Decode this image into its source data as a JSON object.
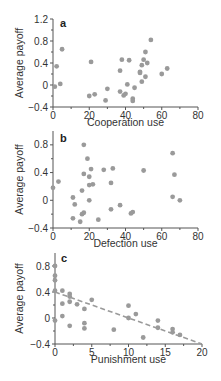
{
  "chart_data": [
    {
      "type": "scatter",
      "panel_label": "a",
      "xlabel": "Cooperation use",
      "ylabel": "Average payoff",
      "xlim": [
        0,
        80
      ],
      "ylim": [
        -0.4,
        1.2
      ],
      "xticks": [
        0,
        20,
        40,
        60,
        80
      ],
      "yticks": [
        -0.4,
        0,
        0.4,
        0.8,
        1.2
      ],
      "ytick_labels": [
        "−0.4",
        "0",
        "0.4",
        "0.8",
        "1.2"
      ],
      "grid": false,
      "points": [
        [
          1,
          -0.03
        ],
        [
          2,
          0.34
        ],
        [
          4,
          0.02
        ],
        [
          5,
          0.65
        ],
        [
          20,
          -0.2
        ],
        [
          21,
          0.42
        ],
        [
          23,
          -0.17
        ],
        [
          29,
          -0.28
        ],
        [
          30,
          -0.07
        ],
        [
          37,
          0.26
        ],
        [
          37,
          -0.12
        ],
        [
          38,
          0.46
        ],
        [
          39,
          -0.19
        ],
        [
          40,
          -0.16
        ],
        [
          41,
          0.01
        ],
        [
          42,
          0.45
        ],
        [
          44,
          -0.25
        ],
        [
          44,
          -0.29
        ],
        [
          45,
          -0.05
        ],
        [
          48,
          0.24
        ],
        [
          48,
          0.22
        ],
        [
          49,
          0.36
        ],
        [
          49,
          0.06
        ],
        [
          50,
          0.46
        ],
        [
          51,
          0.6
        ],
        [
          51,
          0.15
        ],
        [
          52,
          0.4
        ],
        [
          54,
          0.82
        ],
        [
          60,
          0.2
        ],
        [
          63,
          0.3
        ]
      ]
    },
    {
      "type": "scatter",
      "panel_label": "b",
      "xlabel": "Defection use",
      "ylabel": "Average payoff",
      "xlim": [
        0,
        80
      ],
      "ylim": [
        -0.4,
        1.0
      ],
      "xticks": [
        0,
        20,
        40,
        60,
        80
      ],
      "yticks": [
        -0.4,
        0,
        0.4,
        0.8
      ],
      "ytick_labels": [
        "−0.4",
        "0",
        "0.4",
        "0.8"
      ],
      "grid": false,
      "points": [
        [
          0,
          0.18
        ],
        [
          3,
          0.27
        ],
        [
          11,
          0.04
        ],
        [
          11,
          -0.26
        ],
        [
          12,
          -0.06
        ],
        [
          15,
          -0.31
        ],
        [
          16,
          0.14
        ],
        [
          16,
          -0.2
        ],
        [
          17,
          0.8
        ],
        [
          17,
          0.38
        ],
        [
          17,
          -0.18
        ],
        [
          19,
          0.6
        ],
        [
          20,
          0.34
        ],
        [
          20,
          0.22
        ],
        [
          20,
          0.0
        ],
        [
          21,
          0.45
        ],
        [
          22,
          0.23
        ],
        [
          25,
          -0.28
        ],
        [
          28,
          0.44
        ],
        [
          32,
          0.25
        ],
        [
          32,
          -0.13
        ],
        [
          33,
          0.46
        ],
        [
          37,
          -0.07
        ],
        [
          43,
          -0.19
        ],
        [
          44,
          -0.17
        ],
        [
          50,
          0.43
        ],
        [
          66,
          0.68
        ],
        [
          66,
          0.05
        ],
        [
          67,
          0.37
        ],
        [
          70,
          0.0
        ]
      ]
    },
    {
      "type": "scatter",
      "panel_label": "c",
      "xlabel": "Punishment use",
      "ylabel": "Average payoff",
      "xlim": [
        0,
        20
      ],
      "ylim": [
        -0.4,
        1.0
      ],
      "xticks": [
        0,
        5,
        10,
        15,
        20
      ],
      "yticks": [
        -0.4,
        0,
        0.4,
        0.8
      ],
      "ytick_labels": [
        "−0.4",
        "0",
        "0.4",
        "0.8"
      ],
      "grid": false,
      "points": [
        [
          0,
          0.8
        ],
        [
          0,
          0.65
        ],
        [
          0,
          0.58
        ],
        [
          0,
          0.42
        ],
        [
          0,
          -0.04
        ],
        [
          1,
          0.42
        ],
        [
          1,
          0.22
        ],
        [
          1,
          0.03
        ],
        [
          2,
          0.37
        ],
        [
          2,
          0.33
        ],
        [
          2,
          0.25
        ],
        [
          2,
          -0.12
        ],
        [
          3,
          0.21
        ],
        [
          4,
          0.14
        ],
        [
          4,
          -0.08
        ],
        [
          4,
          -0.16
        ],
        [
          5,
          0.28
        ],
        [
          8,
          -0.18
        ],
        [
          10,
          0.19
        ],
        [
          10,
          0.0
        ],
        [
          11,
          0.06
        ],
        [
          12,
          -0.3
        ],
        [
          14,
          -0.04
        ],
        [
          14,
          -0.15
        ],
        [
          16,
          -0.17
        ],
        [
          16,
          -0.22
        ],
        [
          17,
          -0.26
        ]
      ],
      "trend_line": {
        "style": "dashed",
        "from": [
          0,
          0.4
        ],
        "to": [
          20,
          -0.4
        ]
      }
    }
  ],
  "panels": {
    "a": {
      "label": "a",
      "xlabel": "Cooperation use",
      "ylabel": "Average payoff"
    },
    "b": {
      "label": "b",
      "xlabel": "Defection use",
      "ylabel": "Average payoff"
    },
    "c": {
      "label": "c",
      "xlabel": "Punishment use",
      "ylabel": "Average payoff"
    }
  },
  "colors": {
    "point": "#9a9a9a",
    "axis": "#555555",
    "trend": "#9a9a9a"
  }
}
